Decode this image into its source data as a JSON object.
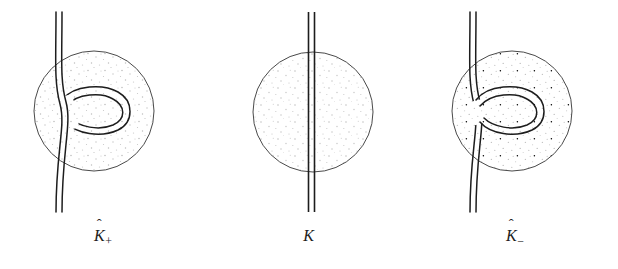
{
  "figure": {
    "name": "skein-triple-figure",
    "background_color": "#ffffff",
    "ink_color": "#1d1d1d",
    "stipple_color": "#b9b9b9",
    "disk_outline_color": "#4a4a4a",
    "width": 618,
    "height": 269
  },
  "panels": [
    {
      "id": "k-plus",
      "caption_base": "K",
      "caption_hat": "ˆ",
      "caption_sub": "+",
      "caption_full": "K̂₊",
      "crossing": "positive",
      "over_strand": "vertical-strand",
      "under_strand": "loop-strand",
      "disk": {
        "cx": 94,
        "cy": 111,
        "r": 60
      },
      "strand_top_y": 12,
      "strand_bottom_y": 212,
      "band_width": 6
    },
    {
      "id": "k-zero",
      "caption_base": "K",
      "caption_hat": "",
      "caption_sub": "",
      "caption_full": "K",
      "crossing": "none",
      "over_strand": "",
      "under_strand": "",
      "disk": {
        "cx": 107,
        "cy": 112,
        "r": 60
      },
      "strand_top_y": 12,
      "strand_bottom_y": 212,
      "band_width": 6
    },
    {
      "id": "k-minus",
      "caption_base": "K",
      "caption_hat": "ˆ",
      "caption_sub": "−",
      "caption_full": "K̂₋",
      "crossing": "negative",
      "over_strand": "loop-strand",
      "under_strand": "vertical-strand",
      "disk": {
        "cx": 100,
        "cy": 111,
        "r": 60
      },
      "strand_top_y": 12,
      "strand_bottom_y": 212,
      "band_width": 6
    }
  ]
}
